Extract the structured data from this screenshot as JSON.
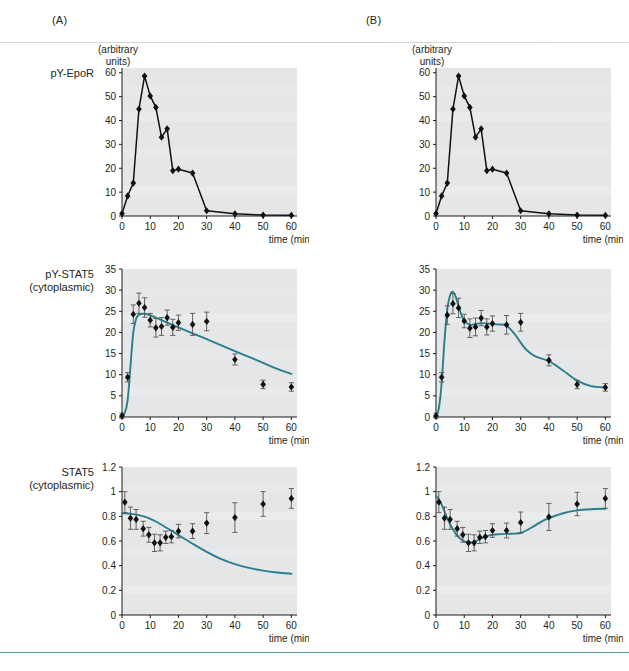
{
  "figure": {
    "panels": [
      {
        "id": "A",
        "label": "(A)"
      },
      {
        "id": "B",
        "label": "(B)"
      }
    ],
    "rows": [
      {
        "id": "pY-EpoR",
        "label": "pY-EpoR",
        "sublabel": "",
        "units": "(arbitrary\nunits)"
      },
      {
        "id": "pY-STAT5",
        "label": "pY-STAT5",
        "sublabel": "(cytoplasmic)",
        "units": ""
      },
      {
        "id": "STAT5",
        "label": "STAT5",
        "sublabel": "(cytoplasmic)",
        "units": ""
      }
    ],
    "xlabel": "time (min)",
    "units_text_line1": "(arbitrary",
    "units_text_line2": "units)",
    "accent_color": "#2a7f8c",
    "plot_bg": "#e4e6e8",
    "marker_color": "#111111"
  },
  "chart_data": [
    {
      "id": "A-pY-EpoR",
      "type": "line",
      "panel": "A",
      "title": "pY-EpoR",
      "xlabel": "time (min)",
      "ylabel": "(arbitrary units)",
      "xlim": [
        0,
        62
      ],
      "ylim": [
        0,
        62
      ],
      "xticks": [
        0,
        10,
        20,
        30,
        40,
        50,
        60
      ],
      "yticks": [
        0,
        10,
        20,
        30,
        40,
        50,
        60
      ],
      "grid": false,
      "has_fit_curve": false,
      "has_error_bars": false,
      "x": [
        0,
        2,
        4,
        6,
        8,
        10,
        12,
        14,
        16,
        18,
        20,
        25,
        30,
        40,
        50,
        60
      ],
      "values": [
        1.0,
        8.4,
        13.8,
        44.8,
        58.6,
        50.3,
        45.5,
        33.0,
        36.5,
        19.0,
        19.6,
        18.0,
        2.2,
        0.9,
        0.4,
        0.3
      ]
    },
    {
      "id": "A-pY-STAT5",
      "type": "scatter",
      "panel": "A",
      "title": "pY-STAT5 (cytoplasmic)",
      "xlabel": "time (min)",
      "ylabel": "",
      "xlim": [
        0,
        62
      ],
      "ylim": [
        0,
        35
      ],
      "xticks": [
        0,
        10,
        20,
        30,
        40,
        50,
        60
      ],
      "yticks": [
        0,
        5,
        10,
        15,
        20,
        25,
        30,
        35
      ],
      "grid": false,
      "has_fit_curve": true,
      "has_error_bars": true,
      "x": [
        0,
        2,
        4,
        6,
        8,
        10,
        12,
        14,
        16,
        18,
        20,
        25,
        30,
        40,
        50,
        60
      ],
      "values": [
        0.3,
        9.4,
        24.3,
        26.9,
        25.9,
        22.9,
        21.1,
        21.4,
        23.5,
        21.2,
        22.3,
        21.9,
        22.6,
        13.6,
        7.7,
        7.1
      ],
      "errors": [
        0.6,
        1.1,
        2.2,
        2.4,
        2.3,
        1.6,
        2.2,
        2.1,
        1.8,
        1.9,
        1.8,
        2.6,
        2.2,
        1.3,
        1.0,
        1.0
      ],
      "fit_x": [
        0,
        1,
        2,
        3,
        4,
        5,
        6,
        8,
        10,
        12,
        15,
        20,
        25,
        30,
        35,
        40,
        45,
        50,
        55,
        60
      ],
      "fit_y": [
        0.2,
        1.0,
        4.0,
        12.0,
        20.0,
        23.2,
        24.2,
        24.4,
        24.0,
        23.5,
        22.6,
        21.2,
        19.8,
        18.4,
        17.0,
        15.6,
        14.2,
        12.8,
        11.4,
        10.2
      ]
    },
    {
      "id": "A-STAT5",
      "type": "scatter",
      "panel": "A",
      "title": "STAT5 (cytoplasmic)",
      "xlabel": "time (min)",
      "ylabel": "",
      "xlim": [
        0,
        62
      ],
      "ylim": [
        0,
        1.2
      ],
      "xticks": [
        0,
        10,
        20,
        30,
        40,
        50,
        60
      ],
      "yticks": [
        0,
        0.2,
        0.4,
        0.6,
        0.8,
        1,
        1.2
      ],
      "grid": false,
      "has_fit_curve": true,
      "has_error_bars": true,
      "x": [
        1,
        3,
        5,
        7.5,
        9.5,
        11.5,
        13.5,
        15.5,
        17.5,
        20,
        25,
        30,
        40,
        50,
        60
      ],
      "values": [
        0.915,
        0.785,
        0.775,
        0.7,
        0.65,
        0.585,
        0.585,
        0.63,
        0.635,
        0.68,
        0.68,
        0.745,
        0.79,
        0.9,
        0.945
      ],
      "errors": [
        0.085,
        0.09,
        0.08,
        0.06,
        0.06,
        0.07,
        0.065,
        0.05,
        0.05,
        0.055,
        0.06,
        0.085,
        0.12,
        0.1,
        0.08
      ],
      "fit_x": [
        0,
        2,
        4,
        6,
        8,
        10,
        12,
        15,
        20,
        25,
        30,
        35,
        40,
        45,
        50,
        55,
        60
      ],
      "fit_y": [
        0.825,
        0.823,
        0.818,
        0.81,
        0.797,
        0.78,
        0.758,
        0.718,
        0.648,
        0.578,
        0.512,
        0.455,
        0.413,
        0.382,
        0.36,
        0.345,
        0.335
      ]
    },
    {
      "id": "B-pY-EpoR",
      "type": "line",
      "panel": "B",
      "title": "pY-EpoR",
      "xlabel": "time (min)",
      "ylabel": "(arbitrary units)",
      "xlim": [
        0,
        62
      ],
      "ylim": [
        0,
        62
      ],
      "xticks": [
        0,
        10,
        20,
        30,
        40,
        50,
        60
      ],
      "yticks": [
        0,
        10,
        20,
        30,
        40,
        50,
        60
      ],
      "grid": false,
      "has_fit_curve": false,
      "has_error_bars": false,
      "x": [
        0,
        2,
        4,
        6,
        8,
        10,
        12,
        14,
        16,
        18,
        20,
        25,
        30,
        40,
        50,
        60
      ],
      "values": [
        1.0,
        8.4,
        13.8,
        44.8,
        58.6,
        50.3,
        45.5,
        33.0,
        36.5,
        19.0,
        19.6,
        18.0,
        2.2,
        0.9,
        0.4,
        0.3
      ]
    },
    {
      "id": "B-pY-STAT5",
      "type": "scatter",
      "panel": "B",
      "title": "pY-STAT5 (cytoplasmic)",
      "xlabel": "time (min)",
      "ylabel": "",
      "xlim": [
        0,
        62
      ],
      "ylim": [
        0,
        35
      ],
      "xticks": [
        0,
        10,
        20,
        30,
        40,
        50,
        60
      ],
      "yticks": [
        0,
        5,
        10,
        15,
        20,
        25,
        30,
        35
      ],
      "grid": false,
      "has_fit_curve": true,
      "has_error_bars": true,
      "x": [
        0,
        2,
        4,
        6,
        8,
        10,
        12,
        14,
        16,
        18,
        20,
        25,
        30,
        40,
        50,
        60
      ],
      "values": [
        0.3,
        9.4,
        24.1,
        26.8,
        25.8,
        22.7,
        21.0,
        21.3,
        23.4,
        21.3,
        22.1,
        21.8,
        22.4,
        13.4,
        7.7,
        7.0
      ],
      "errors": [
        0.6,
        1.1,
        2.2,
        2.4,
        2.3,
        1.6,
        2.2,
        2.1,
        1.8,
        1.9,
        1.8,
        2.2,
        2.1,
        1.3,
        1.0,
        0.9
      ],
      "fit_x": [
        0,
        1,
        2,
        3,
        4,
        5,
        6,
        7,
        8,
        9,
        10,
        12,
        14,
        16,
        18,
        20,
        22,
        25,
        28,
        30,
        32,
        35,
        40,
        45,
        50,
        55,
        60
      ],
      "fit_y": [
        0.3,
        2.0,
        8.0,
        18.0,
        25.5,
        28.8,
        29.6,
        28.4,
        26.2,
        24.2,
        22.8,
        21.8,
        22.0,
        22.2,
        22.1,
        22.0,
        21.9,
        21.6,
        19.5,
        17.6,
        15.9,
        14.4,
        13.2,
        11.0,
        8.6,
        7.3,
        7.0
      ]
    },
    {
      "id": "B-STAT5",
      "type": "scatter",
      "panel": "B",
      "title": "STAT5 (cytoplasmic)",
      "xlabel": "time (min)",
      "ylabel": "",
      "xlim": [
        0,
        62
      ],
      "ylim": [
        0,
        1.2
      ],
      "xticks": [
        0,
        10,
        20,
        30,
        40,
        50,
        60
      ],
      "yticks": [
        0,
        0.2,
        0.4,
        0.6,
        0.8,
        1,
        1.2
      ],
      "grid": false,
      "has_fit_curve": true,
      "has_error_bars": true,
      "x": [
        1,
        3,
        5,
        7.5,
        9.5,
        11.5,
        13.5,
        15.5,
        17.5,
        20,
        25,
        30,
        40,
        50,
        60
      ],
      "values": [
        0.915,
        0.785,
        0.775,
        0.7,
        0.65,
        0.585,
        0.585,
        0.63,
        0.635,
        0.685,
        0.685,
        0.75,
        0.795,
        0.9,
        0.945
      ],
      "errors": [
        0.085,
        0.09,
        0.08,
        0.06,
        0.06,
        0.07,
        0.065,
        0.05,
        0.05,
        0.055,
        0.06,
        0.085,
        0.11,
        0.095,
        0.08
      ],
      "fit_x": [
        0,
        1,
        2,
        3,
        4,
        5,
        6,
        7,
        8,
        9,
        10,
        11,
        12,
        13,
        14,
        15,
        16,
        18,
        20,
        22,
        25,
        28,
        30,
        32,
        35,
        38,
        40,
        45,
        50,
        55,
        60
      ],
      "fit_y": [
        0.965,
        0.94,
        0.895,
        0.84,
        0.785,
        0.735,
        0.695,
        0.66,
        0.632,
        0.612,
        0.598,
        0.59,
        0.588,
        0.59,
        0.598,
        0.61,
        0.622,
        0.64,
        0.65,
        0.655,
        0.658,
        0.66,
        0.665,
        0.685,
        0.725,
        0.765,
        0.785,
        0.825,
        0.848,
        0.858,
        0.862
      ]
    }
  ]
}
